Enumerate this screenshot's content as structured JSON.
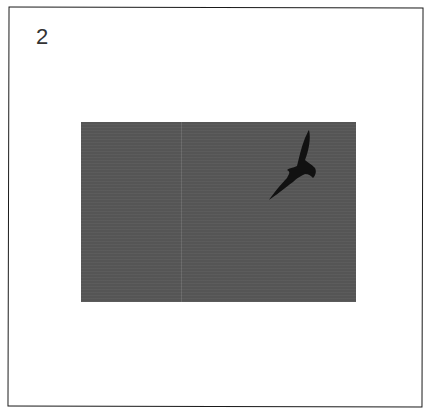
{
  "card": {
    "label": "2",
    "photo": {
      "subject": "bird-silhouette",
      "background_color": "#555555",
      "bird_color": "#111111"
    },
    "border_color": "#1a1a1a"
  }
}
